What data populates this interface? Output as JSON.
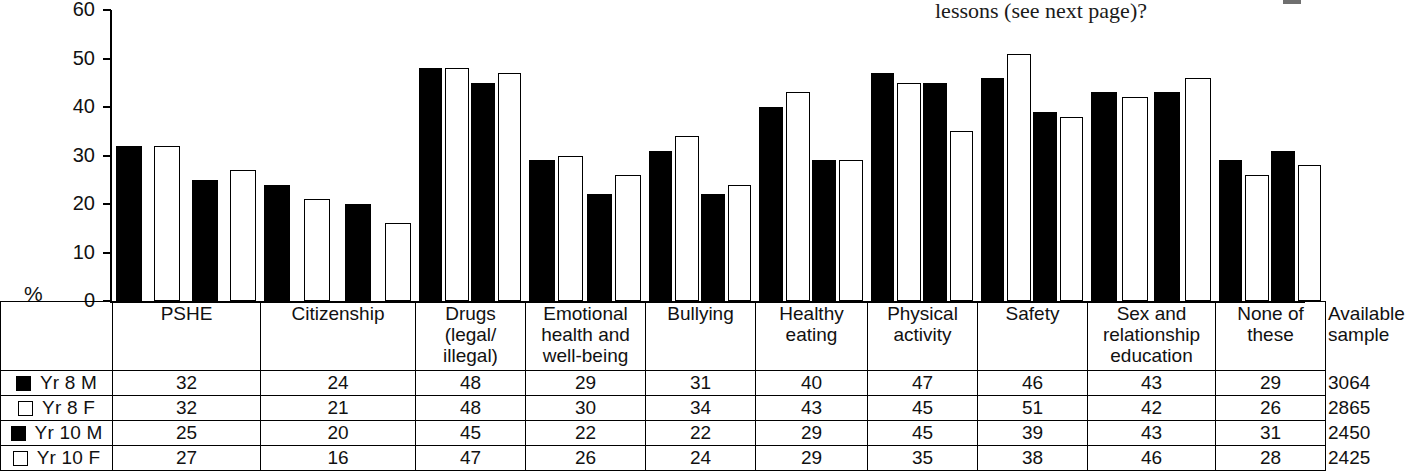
{
  "question": {
    "text": "lessons (see next page)?"
  },
  "axis": {
    "unit_label": "%",
    "ticks": [
      60,
      50,
      40,
      30,
      20,
      10,
      0
    ]
  },
  "legend": [
    {
      "label": "Yr 8 M",
      "swatch": "filled-square-icon"
    },
    {
      "label": "Yr 8 F",
      "swatch": "hollow-square-icon"
    },
    {
      "label": "Yr 10 M",
      "swatch": "filled-square-icon"
    },
    {
      "label": "Yr 10 F",
      "swatch": "hollow-square-icon"
    }
  ],
  "columns": [
    "PSHE",
    "Citizenship",
    "Drugs (legal/ illegal)",
    "Emotional health and well-being",
    "Bullying",
    "Healthy eating",
    "Physical activity",
    "Safety",
    "Sex and relationship education",
    "None of these",
    "Available sample"
  ],
  "column_lines": [
    [
      "PSHE"
    ],
    [
      "Citizenship"
    ],
    [
      "Drugs",
      "(legal/",
      "illegal)"
    ],
    [
      "Emotional",
      "health and",
      "well-being"
    ],
    [
      "Bullying"
    ],
    [
      "Healthy",
      "eating"
    ],
    [
      "Physical",
      "activity"
    ],
    [
      "Safety"
    ],
    [
      "Sex and",
      "relationship",
      "education"
    ],
    [
      "None of these"
    ],
    [
      "Available",
      "sample"
    ]
  ],
  "rows": [
    {
      "label": "Yr 8 M",
      "values": [
        32,
        24,
        48,
        29,
        31,
        40,
        47,
        46,
        43,
        29
      ],
      "sample": 3064
    },
    {
      "label": "Yr 8 F",
      "values": [
        32,
        21,
        48,
        30,
        34,
        43,
        45,
        51,
        42,
        26
      ],
      "sample": 2865
    },
    {
      "label": "Yr 10 M",
      "values": [
        25,
        20,
        45,
        22,
        22,
        29,
        45,
        39,
        43,
        31
      ],
      "sample": 2450
    },
    {
      "label": "Yr 10 F",
      "values": [
        27,
        16,
        47,
        26,
        24,
        29,
        35,
        38,
        46,
        28
      ],
      "sample": 2425
    }
  ],
  "chart_data": {
    "type": "bar",
    "title": "",
    "xlabel": "",
    "ylabel": "%",
    "ylim": [
      0,
      60
    ],
    "yticks": [
      0,
      10,
      20,
      30,
      40,
      50,
      60
    ],
    "grid": false,
    "legend_position": "bottom-left-table",
    "categories": [
      "PSHE",
      "Citizenship",
      "Drugs (legal/illegal)",
      "Emotional health and well-being",
      "Bullying",
      "Healthy eating",
      "Physical activity",
      "Safety",
      "Sex and relationship education",
      "None of these"
    ],
    "series": [
      {
        "name": "Yr 8 M",
        "color": "#000000",
        "values": [
          32,
          24,
          48,
          29,
          31,
          40,
          47,
          46,
          43,
          29
        ]
      },
      {
        "name": "Yr 8 F",
        "color": "#ffffff",
        "values": [
          32,
          21,
          48,
          30,
          34,
          43,
          45,
          51,
          42,
          26
        ]
      },
      {
        "name": "Yr 10 M",
        "color": "#000000",
        "values": [
          25,
          20,
          45,
          22,
          22,
          29,
          45,
          39,
          43,
          31
        ]
      },
      {
        "name": "Yr 10 F",
        "color": "#ffffff",
        "values": [
          27,
          16,
          47,
          26,
          24,
          29,
          35,
          38,
          46,
          28
        ]
      }
    ],
    "available_sample": {
      "Yr 8 M": 3064,
      "Yr 8 F": 2865,
      "Yr 10 M": 2450,
      "Yr 10 F": 2425
    }
  },
  "colors": {
    "male_fill": "#000000",
    "female_fill": "#ffffff",
    "outline": "#000000"
  }
}
